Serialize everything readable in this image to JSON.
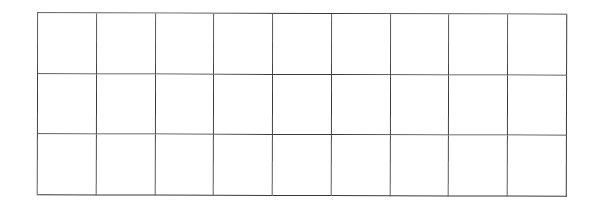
{
  "grid": {
    "rows": 3,
    "columns": 9,
    "line_color": "#3a3a3a",
    "background": "#ffffff",
    "cells": [
      [
        "",
        "",
        "",
        "",
        "",
        "",
        "",
        "",
        ""
      ],
      [
        "",
        "",
        "",
        "",
        "",
        "",
        "",
        "",
        ""
      ],
      [
        "",
        "",
        "",
        "",
        "",
        "",
        "",
        "",
        ""
      ]
    ]
  }
}
